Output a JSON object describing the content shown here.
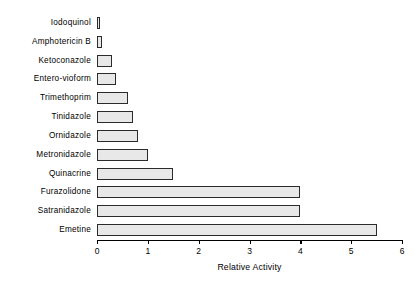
{
  "chart_data": {
    "type": "bar",
    "orientation": "horizontal",
    "title": "",
    "xlabel": "Relative Activity",
    "ylabel": "",
    "xlim": [
      0,
      6
    ],
    "xticks": [
      "0",
      "1",
      "2",
      "3",
      "4",
      "5",
      "6"
    ],
    "grid": false,
    "legend": null,
    "bar_fill_color": "#e8e8e8",
    "bar_edge_color": "#2b2b2b",
    "categories": [
      "Iodoquinol",
      "Amphotericin  B",
      "Ketoconazole",
      "Entero-vioform",
      "Trimethoprim",
      "Tinidazole",
      "Ornidazole",
      "Metronidazole",
      "Quinacrine",
      "Furazolidone",
      "Satranidazole",
      "Emetine"
    ],
    "values": [
      0.05,
      0.1,
      0.3,
      0.37,
      0.6,
      0.7,
      0.8,
      1.0,
      1.5,
      4.0,
      4.0,
      5.5
    ]
  }
}
